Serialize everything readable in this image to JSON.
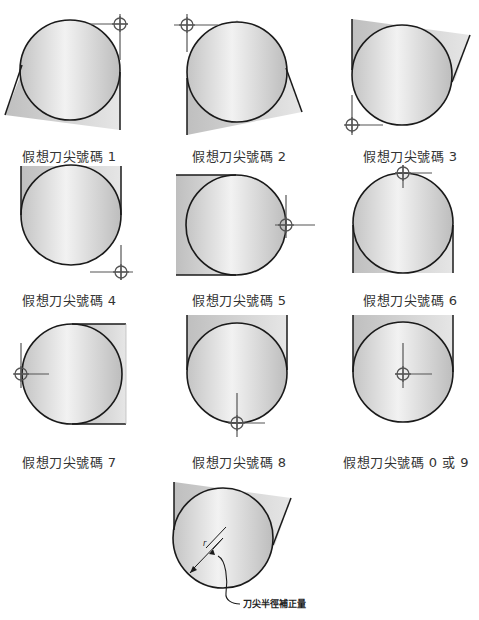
{
  "figures": [
    {
      "id": 1,
      "label": "假想刀尖號碼 1"
    },
    {
      "id": 2,
      "label": "假想刀尖號碼 2"
    },
    {
      "id": 3,
      "label": "假想刀尖號碼 3"
    },
    {
      "id": 4,
      "label": "假想刀尖號碼 4"
    },
    {
      "id": 5,
      "label": "假想刀尖號碼 5"
    },
    {
      "id": 6,
      "label": "假想刀尖號碼 6"
    },
    {
      "id": 7,
      "label": "假想刀尖號碼 7"
    },
    {
      "id": 8,
      "label": "假想刀尖號碼 8"
    },
    {
      "id": "0/9",
      "label": "假想刀尖號碼 0 或 9"
    }
  ],
  "detail": {
    "radius_symbol": "r",
    "annotation": "刀尖半徑補正量"
  },
  "colors": {
    "outline": "#1a1a1a",
    "fill_light": "#eeeeee",
    "fill_dark": "#b8b8b8",
    "crosshair": "#555555",
    "text": "#333333"
  }
}
